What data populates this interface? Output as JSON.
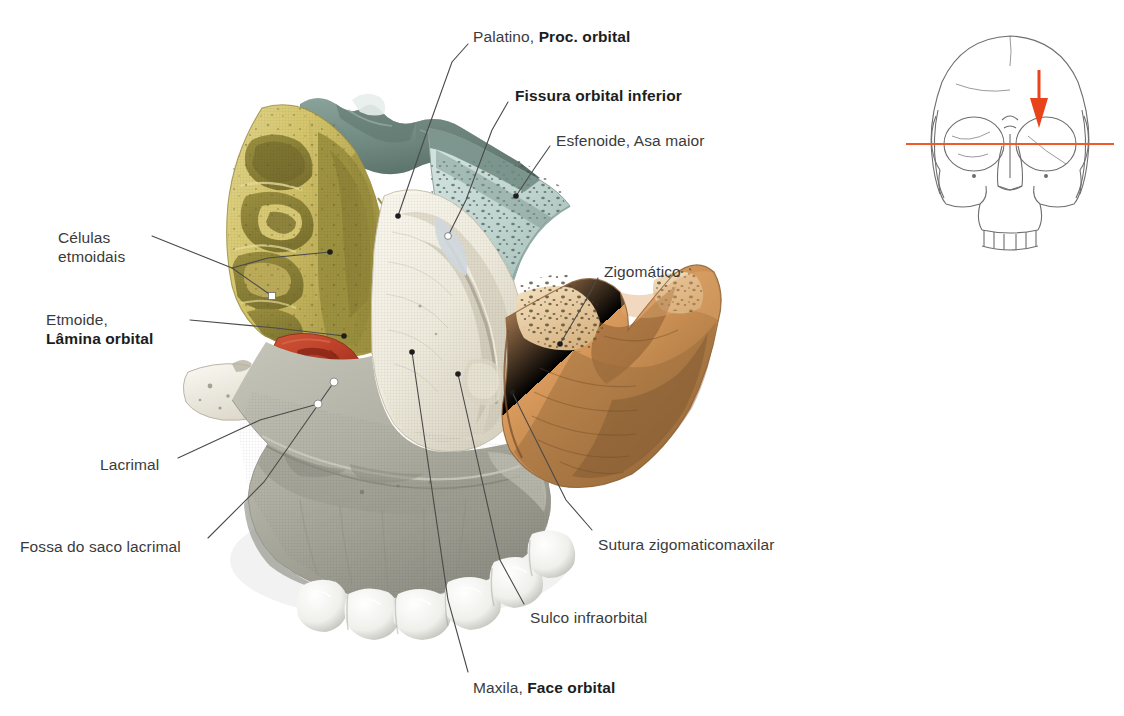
{
  "figure": {
    "kind": "anatomical-illustration",
    "language": "pt-BR",
    "background_color": "#ffffff",
    "label_color": "#3b3b3b",
    "leader_line_color": "#4a4a4a"
  },
  "labels": [
    {
      "id": "palatino",
      "plain": "Palatino,",
      "bold": "Proc. orbital",
      "x": 473,
      "y": 27,
      "anchor": "left",
      "leader": [
        [
          468,
          44
        ],
        [
          452,
          62
        ],
        [
          424,
          140
        ],
        [
          398,
          216
        ]
      ],
      "marker": "dot-dark"
    },
    {
      "id": "fissura-orbital-inferior",
      "plain": "",
      "bold": "Fissura orbital inferior",
      "x": 515,
      "y": 86,
      "anchor": "left",
      "leader": [
        [
          508,
          102
        ],
        [
          492,
          130
        ],
        [
          466,
          200
        ],
        [
          448,
          236
        ]
      ],
      "marker": "dot-white"
    },
    {
      "id": "esfenoide-asa-maior",
      "plain": "Esfenoide, Asa maior",
      "bold": "",
      "x": 556,
      "y": 131,
      "anchor": "left",
      "leader": [
        [
          550,
          146
        ],
        [
          536,
          166
        ],
        [
          516,
          196
        ]
      ],
      "marker": "dot-dark"
    },
    {
      "id": "zigomatico",
      "plain": "Zigomático",
      "bold": "",
      "x": 604,
      "y": 262,
      "anchor": "left",
      "leader": [
        [
          598,
          278
        ],
        [
          586,
          300
        ],
        [
          560,
          344
        ]
      ],
      "marker": "dot-dark"
    },
    {
      "id": "sutura-zigomaticomaxilar",
      "plain": "Sutura zigomaticomaxilar",
      "bold": "",
      "x": 598,
      "y": 535,
      "anchor": "left",
      "leader": [
        [
          592,
          530
        ],
        [
          566,
          500
        ],
        [
          512,
          392
        ]
      ],
      "marker": "dot-dark"
    },
    {
      "id": "sulco-infraorbital",
      "plain": "Sulco infraorbital",
      "bold": "",
      "x": 530,
      "y": 608,
      "anchor": "left",
      "leader": [
        [
          524,
          604
        ],
        [
          500,
          560
        ],
        [
          458,
          374
        ]
      ],
      "marker": "dot-dark"
    },
    {
      "id": "maxila-face-orbital",
      "plain": "Maxila,",
      "bold": "Face orbital",
      "x": 473,
      "y": 678,
      "anchor": "left",
      "leader": [
        [
          468,
          672
        ],
        [
          448,
          600
        ],
        [
          412,
          352
        ]
      ],
      "marker": "dot-dark"
    },
    {
      "id": "celulas-etmoidais",
      "line1": "Células",
      "line2": "etmoidais",
      "bold": "",
      "x": 58,
      "y": 228,
      "anchor": "right",
      "leader_a": [
        [
          152,
          236
        ],
        [
          232,
          268
        ],
        [
          272,
          296
        ]
      ],
      "leader_b": [
        [
          232,
          268
        ],
        [
          268,
          258
        ],
        [
          330,
          252
        ]
      ],
      "marker": "square-white"
    },
    {
      "id": "etmoide-lamina-orbital",
      "plain": "Etmoide,",
      "bold": "Lâmina orbital",
      "x": 46,
      "y": 310,
      "anchor": "right",
      "leader": [
        [
          190,
          320
        ],
        [
          276,
          328
        ],
        [
          344,
          336
        ]
      ],
      "marker": "dot-dark"
    },
    {
      "id": "lacrimal",
      "plain": "Lacrimal",
      "bold": "",
      "x": 100,
      "y": 455,
      "anchor": "left",
      "leader": [
        [
          178,
          458
        ],
        [
          260,
          420
        ],
        [
          318,
          404
        ]
      ],
      "marker": "dot-white"
    },
    {
      "id": "fossa-do-saco-lacrimal",
      "plain": "Fossa do saco lacrimal",
      "bold": "",
      "x": 20,
      "y": 537,
      "anchor": "left",
      "leader": [
        [
          208,
          538
        ],
        [
          264,
          482
        ],
        [
          334,
          382
        ]
      ],
      "marker": "dot-white"
    }
  ],
  "bones": [
    {
      "id": "ethmoid",
      "name": "Células etmoidais / Lâmina orbital",
      "color": "#d8c974",
      "shadow": "#8f8536"
    },
    {
      "id": "palatine",
      "name": "Palatino, processo orbital",
      "color": "#7d968e",
      "shadow": "#5b726b"
    },
    {
      "id": "sphenoid",
      "name": "Esfenoide, asa maior",
      "color": "#c6dbd6",
      "shadow": "#9bb5af"
    },
    {
      "id": "maxilla-orbital",
      "name": "Maxila, face orbital",
      "color": "#f0ece0",
      "shadow": "#c9c4b4"
    },
    {
      "id": "maxilla-body",
      "name": "Maxila, corpo",
      "color": "#b3b3a8",
      "shadow": "#8b8b81"
    },
    {
      "id": "lacrimal",
      "name": "Lacrimal",
      "color": "#c1432c",
      "shadow": "#8e2c1c"
    },
    {
      "id": "zygomatic",
      "name": "Zigomático",
      "color": "#e09c62",
      "shadow": "#9c6633"
    },
    {
      "id": "zygomatic-cut",
      "name": "Zigomático, osso esponjoso",
      "color": "#f0d9b4",
      "shadow": "#a07b45"
    },
    {
      "id": "bone-fragment",
      "name": "Fragmento ósseo",
      "color": "#f2f0e6",
      "shadow": "#bdbaae"
    },
    {
      "id": "teeth",
      "name": "Dentes molares",
      "color": "#f6f6f4",
      "shadow": "#b9b9b5"
    }
  ],
  "orientation_diagram": {
    "name": "Diagrama de orientação — crânio em vista frontal",
    "outline_color": "#6e6e6e",
    "section_line_color": "#ef5a28",
    "arrow_color": "#e8431a",
    "x": 906,
    "y": 28,
    "width": 208,
    "height": 208
  }
}
